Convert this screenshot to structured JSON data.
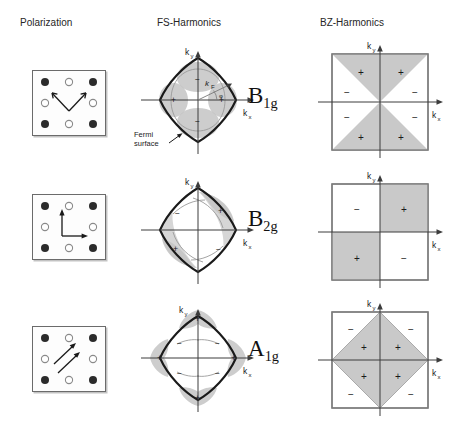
{
  "headers": {
    "polarization": "Polarization",
    "fs_harmonics": "FS-Harmonics",
    "bz_harmonics": "BZ-Harmonics"
  },
  "axes": {
    "kx_label": "k",
    "kx_sub": "x",
    "ky_label": "k",
    "ky_sub": "y",
    "kf_label": "k",
    "kf_sub": "F",
    "phi_label": "φ"
  },
  "annotations": {
    "fermi_surface_line1": "Fermi",
    "fermi_surface_line2": "surface"
  },
  "signs": {
    "plus": "+",
    "minus": "−"
  },
  "colors": {
    "shade": "#c9c9c9",
    "lobe_shade": "#c4c4c4",
    "outline": "#1a1a1a",
    "box_border": "#6b6b6b",
    "axis": "#3c3c3c",
    "filled_circle": "#2b2b2b",
    "open_circle": "#ffffff"
  },
  "rows": [
    {
      "id": "row-1",
      "symmetry_letter": "B",
      "symmetry_sub": "1g",
      "polarization": {
        "name": "polarization-b1g",
        "arrows": "two arrows forming a V pointing up-left and up-right"
      },
      "fs": {
        "name": "fs-harmonic-b1g",
        "lobe_signs": [
          "+",
          "+",
          "−",
          "−"
        ],
        "has_kf_vector": true,
        "has_fermi_label": true
      },
      "bz": {
        "name": "bz-harmonic-b1g",
        "pattern": "x-split-triangles",
        "cells": [
          {
            "sign": "+",
            "shaded": true
          },
          {
            "sign": "+",
            "shaded": true
          },
          {
            "sign": "−",
            "shaded": false
          },
          {
            "sign": "−",
            "shaded": false
          },
          {
            "sign": "−",
            "shaded": false
          },
          {
            "sign": "−",
            "shaded": false
          },
          {
            "sign": "+",
            "shaded": true
          },
          {
            "sign": "+",
            "shaded": true
          }
        ]
      }
    },
    {
      "id": "row-2",
      "symmetry_letter": "B",
      "symmetry_sub": "2g",
      "polarization": {
        "name": "polarization-b2g",
        "arrows": "two arrows pointing up and right"
      },
      "fs": {
        "name": "fs-harmonic-b2g",
        "lobe_signs": [
          "+",
          "−",
          "+",
          "−"
        ],
        "has_kf_vector": false,
        "has_fermi_label": false
      },
      "bz": {
        "name": "bz-harmonic-b2g",
        "pattern": "quadrant-checkerboard",
        "cells": [
          {
            "sign": "−",
            "shaded": false
          },
          {
            "sign": "+",
            "shaded": true
          },
          {
            "sign": "+",
            "shaded": true
          },
          {
            "sign": "−",
            "shaded": false
          }
        ]
      }
    },
    {
      "id": "row-3",
      "symmetry_letter": "A",
      "symmetry_sub": "1g",
      "polarization": {
        "name": "polarization-a1g",
        "arrows": "two parallel diagonal arrows pointing up-right"
      },
      "fs": {
        "name": "fs-harmonic-a1g",
        "lobe_signs": [
          "+",
          "+",
          "+",
          "+"
        ],
        "diag_signs": [
          "−",
          "−",
          "−",
          "−"
        ],
        "has_kf_vector": false,
        "has_fermi_label": false
      },
      "bz": {
        "name": "bz-harmonic-a1g",
        "pattern": "diamond",
        "cells": [
          {
            "sign": "+",
            "shaded": true
          },
          {
            "sign": "+",
            "shaded": true
          },
          {
            "sign": "+",
            "shaded": true
          },
          {
            "sign": "+",
            "shaded": true
          },
          {
            "sign": "−",
            "shaded": false
          },
          {
            "sign": "−",
            "shaded": false
          },
          {
            "sign": "−",
            "shaded": false
          },
          {
            "sign": "−",
            "shaded": false
          }
        ]
      }
    }
  ]
}
